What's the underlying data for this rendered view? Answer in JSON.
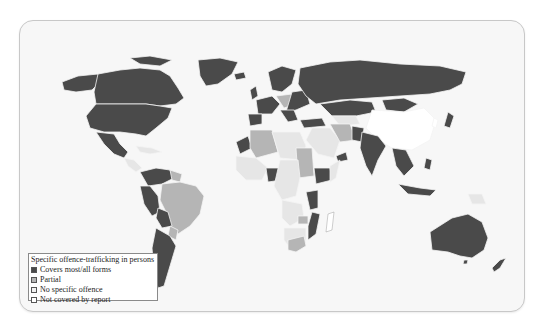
{
  "map": {
    "title": "World map: specific offence-trafficking in persons",
    "colors": {
      "covers": "#4a4a4a",
      "partial": "#b5b5b5",
      "none": "#e6e6e6",
      "not_covered": "#ffffff",
      "border": "#f4f4f4",
      "ocean": "#f7f7f7"
    }
  },
  "legend": {
    "title": "Specific offence-trafficking in persons",
    "items": [
      {
        "label": "Covers most/all forms",
        "color": "#4a4a4a"
      },
      {
        "label": "Partial",
        "color": "#b5b5b5"
      },
      {
        "label": "No specific offence",
        "color": "#f2f2f2"
      },
      {
        "label": "Not covered by report",
        "color": "#ffffff"
      }
    ]
  }
}
